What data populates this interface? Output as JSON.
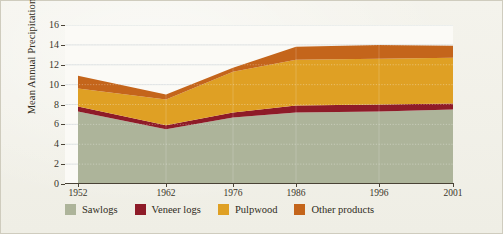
{
  "chart_data": {
    "type": "area",
    "stacked": true,
    "title": "",
    "xlabel": "",
    "ylabel": "Mean Annual Precipitation",
    "categories": [
      "1952",
      "1962",
      "1976",
      "1986",
      "1996",
      "2001"
    ],
    "x_positions": [
      1952,
      1962,
      1976,
      1986,
      1996,
      2001
    ],
    "xlim": [
      1952,
      2001
    ],
    "ylim": [
      0,
      16
    ],
    "y_ticks": [
      0,
      2,
      4,
      6,
      8,
      10,
      12,
      14,
      16
    ],
    "y_tick_labels": [
      "0",
      "2",
      "4",
      "6",
      "8",
      "10",
      "12",
      "14",
      "16"
    ],
    "grid": true,
    "grid_axis": "y",
    "legend_position": "bottom",
    "series": [
      {
        "name": "Sawlogs",
        "color": "#adb49a",
        "values": [
          7.3,
          5.5,
          6.7,
          7.2,
          7.3,
          7.5
        ]
      },
      {
        "name": "Veneer logs",
        "color": "#8e1b28",
        "values": [
          0.5,
          0.4,
          0.5,
          0.7,
          0.7,
          0.6
        ]
      },
      {
        "name": "Pulpwood",
        "color": "#dfa024",
        "values": [
          1.8,
          2.6,
          4.1,
          4.6,
          4.6,
          4.6
        ]
      },
      {
        "name": "Other products",
        "color": "#c4651b",
        "values": [
          1.3,
          0.5,
          0.4,
          1.3,
          1.4,
          1.2
        ]
      }
    ],
    "cumulative_tops": {
      "Sawlogs": [
        7.3,
        5.5,
        6.7,
        7.2,
        7.3,
        7.5
      ],
      "Veneer logs": [
        7.8,
        5.9,
        7.2,
        7.9,
        8.0,
        8.1
      ],
      "Pulpwood": [
        9.6,
        8.5,
        11.3,
        12.5,
        12.6,
        12.7
      ],
      "Other products": [
        10.9,
        9.0,
        11.7,
        13.8,
        14.0,
        13.9
      ]
    }
  },
  "legend": {
    "items": [
      {
        "label": "Sawlogs",
        "color": "#adb49a"
      },
      {
        "label": "Veneer logs",
        "color": "#8e1b28"
      },
      {
        "label": "Pulpwood",
        "color": "#dfa024"
      },
      {
        "label": "Other products",
        "color": "#c4651b"
      }
    ]
  },
  "colors": {
    "page_background": "#f3f2ea",
    "plot_background": "#fbfaf6",
    "axis": "#4a4336",
    "grid": "#cfd6d9",
    "text": "#332f24"
  }
}
